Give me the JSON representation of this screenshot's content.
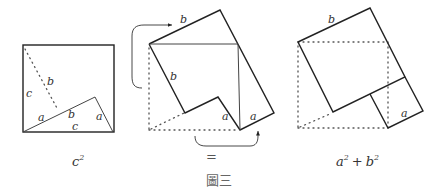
{
  "figure": {
    "caption": "圖三",
    "equals": "="
  },
  "panels": [
    {
      "name": "c-squared",
      "caption_base": "c",
      "caption_exp": "2",
      "labels": {
        "left_side": "c",
        "dotted": "b",
        "tri_a_left": "a",
        "tri_b": "b",
        "tri_a_right": "a",
        "base_c": "c"
      }
    },
    {
      "name": "rearrangement",
      "labels": {
        "top_b": "b",
        "left_b": "b",
        "notch_a": "a",
        "right_a": "a"
      }
    },
    {
      "name": "a2-plus-b2",
      "caption": {
        "a": "a",
        "a_exp": "2",
        "plus": "+",
        "b": "b",
        "b_exp": "2"
      },
      "labels": {
        "top_b": "b",
        "small_a": "a"
      }
    }
  ],
  "colors": {
    "stroke": "#222222",
    "dotted": "#555555",
    "background": "#ffffff"
  }
}
